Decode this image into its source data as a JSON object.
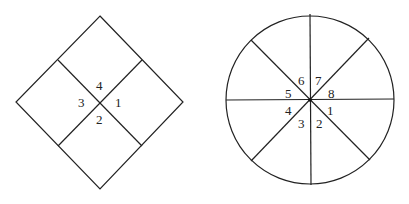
{
  "diagrams": {
    "diamond": {
      "shape": "square rotated 45° divided into 4 quadrants",
      "labels": [
        "1",
        "2",
        "3",
        "4"
      ]
    },
    "circle": {
      "shape": "circle divided into 8 sectors",
      "labels": [
        "1",
        "2",
        "3",
        "4",
        "5",
        "6",
        "7",
        "8"
      ]
    }
  },
  "colors": {
    "stroke": "#222222",
    "background": "#ffffff"
  }
}
